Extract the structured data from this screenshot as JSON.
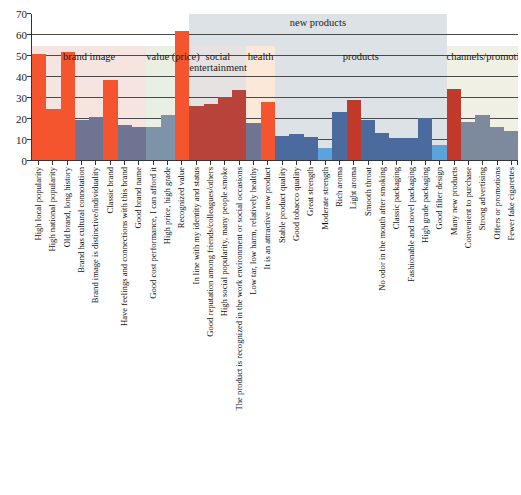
{
  "chart_data": {
    "type": "bar",
    "title": "",
    "xlabel": "",
    "ylabel": "",
    "ylim": [
      0,
      70
    ],
    "yticks": [
      0,
      10,
      20,
      30,
      40,
      50,
      60,
      70
    ],
    "grid": true,
    "legend": "none",
    "categories": [
      "High local popularity",
      "High national popularity",
      "Old brand, long history",
      "Brand has cultural connotation",
      "Brand image is distinctive/individuality",
      "Classic brand",
      "Have feelings and connections with this brand",
      "Good brand name",
      "Good cost performance, I can afford it",
      "High price, high grade",
      "Recognized value",
      "In line with my identity and status",
      "Good reputation among friends/colleagues/others",
      "High social popularity, many people smoke",
      "The product is recognized in the work environment or social occasions",
      "Low tar, low harm, relatively healthy",
      "It is an attractive new product",
      "Stable product quality",
      "Good tobacco quality",
      "Great strength",
      "Moderate strength",
      "Rich aroma",
      "Light aroma",
      "Smooth throat",
      "No odor in the mouth after smoking",
      "Classic packaging",
      "Fashionable and novel packaging",
      "High grade packaging",
      "Good filter design",
      "Many new products",
      "Convenient to purchase",
      "Strong advertising",
      "Offers or promotions",
      "Fewer fake cigarettes"
    ],
    "values": [
      51,
      25,
      52,
      19.5,
      21,
      38.5,
      17,
      16,
      16,
      22,
      62,
      26,
      27,
      30.5,
      34,
      18,
      28,
      12,
      13,
      11.5,
      6,
      23.5,
      29,
      19.5,
      13.5,
      11,
      11,
      20.5,
      7.5,
      34.5,
      18.5,
      22,
      16,
      14.5
    ],
    "bar_colors": [
      "#f4552e",
      "#f4552e",
      "#f4552e",
      "#6f7493",
      "#6f7493",
      "#f4552e",
      "#6f7493",
      "#6f7493",
      "#7d93a8",
      "#7d93a8",
      "#f4552e",
      "#b8433a",
      "#b8433a",
      "#b8433a",
      "#b8433a",
      "#6f7493",
      "#f4552e",
      "#4b6a9e",
      "#4b6a9e",
      "#4b6a9e",
      "#5ba3d9",
      "#4b6a9e",
      "#c0392b",
      "#4b6a9e",
      "#4b6a9e",
      "#4b6a9e",
      "#4b6a9e",
      "#4b6a9e",
      "#5ba3d9",
      "#c0392b",
      "#7d8a9e",
      "#7d8a9e",
      "#7d8a9e",
      "#7d8a9e"
    ],
    "groups": [
      {
        "label": "brand image",
        "start": 0,
        "end": 8,
        "color": "#f5e4df",
        "row": 1
      },
      {
        "label": "value (price)",
        "start": 8,
        "end": 11,
        "color": "#e9efe3",
        "row": 1
      },
      {
        "label": "social\nentertainment",
        "start": 11,
        "end": 15,
        "color": "#e6e2e2",
        "row": 1
      },
      {
        "label": "health",
        "start": 15,
        "end": 17,
        "color": "#fbe8d8",
        "row": 1
      },
      {
        "label": "products",
        "start": 17,
        "end": 29,
        "color": "#dde2e6",
        "row": 1
      },
      {
        "label": "channels/promotion",
        "start": 29,
        "end": 34,
        "color": "#f1f0e4",
        "row": 1
      },
      {
        "label": "new products",
        "start": 11,
        "end": 29,
        "color": "#dde2e6",
        "row": 0
      }
    ]
  }
}
